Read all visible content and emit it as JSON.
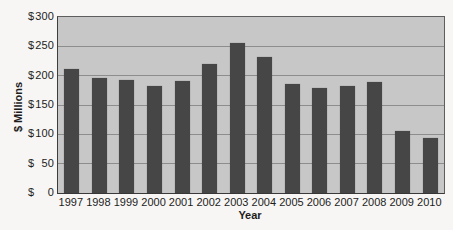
{
  "chart_data": {
    "type": "bar",
    "title": "",
    "categories": [
      "1997",
      "1998",
      "1999",
      "2000",
      "2001",
      "2002",
      "2003",
      "2004",
      "2005",
      "2006",
      "2007",
      "2008",
      "2009",
      "2010"
    ],
    "values": [
      212,
      196,
      193,
      183,
      191,
      220,
      255,
      232,
      186,
      179,
      182,
      189,
      106,
      93
    ],
    "xlabel": "Year",
    "ylabel": "$ Millions",
    "ylim": [
      0,
      300
    ],
    "ytick_step": 50,
    "y_ticks": [
      {
        "symbol": "$",
        "value": "300"
      },
      {
        "symbol": "$",
        "value": "250"
      },
      {
        "symbol": "$",
        "value": "200"
      },
      {
        "symbol": "$",
        "value": "150"
      },
      {
        "symbol": "$",
        "value": "100"
      },
      {
        "symbol": "$",
        "value": "50"
      },
      {
        "symbol": "$",
        "value": "0"
      }
    ],
    "grid": true,
    "legend": "none",
    "bar_color": "#464646",
    "plot_background": "#c7c7c7",
    "gridline_color": "#8d8d8d",
    "page_background": "#f7f6f4"
  }
}
